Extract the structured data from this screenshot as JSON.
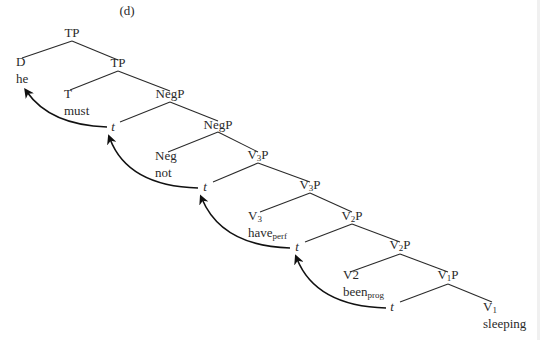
{
  "figure_label": "(d)",
  "figure_label_pos": [
    127,
    4
  ],
  "line_color": "#2a2a2a",
  "nodes": [
    {
      "id": "tp1",
      "cat": "TP",
      "sub": "",
      "word": "",
      "word_sub": "",
      "x": 72,
      "y": 26
    },
    {
      "id": "d",
      "cat": "D",
      "sub": "",
      "word": "he",
      "word_sub": "",
      "x": 16,
      "y": 55,
      "align": "left"
    },
    {
      "id": "tp2",
      "cat": "TP",
      "sub": "",
      "word": "",
      "word_sub": "",
      "x": 118,
      "y": 56
    },
    {
      "id": "t_head",
      "cat": "T",
      "sub": "",
      "word": "must",
      "word_sub": "",
      "x": 64,
      "y": 87,
      "align": "left"
    },
    {
      "id": "negp1",
      "cat": "NegP",
      "sub": "",
      "word": "",
      "word_sub": "",
      "x": 170,
      "y": 87
    },
    {
      "id": "trace1",
      "cat": "t",
      "sub": "",
      "word": "",
      "word_sub": "",
      "x": 113,
      "y": 120,
      "italic": true
    },
    {
      "id": "negp2",
      "cat": "NegP",
      "sub": "",
      "word": "",
      "word_sub": "",
      "x": 218,
      "y": 118
    },
    {
      "id": "neg",
      "cat": "Neg",
      "sub": "",
      "word": "not",
      "word_sub": "",
      "x": 155,
      "y": 149,
      "align": "left"
    },
    {
      "id": "v3p1",
      "cat": "V",
      "sub": "3",
      "cat_suffix": "P",
      "word": "",
      "word_sub": "",
      "x": 258,
      "y": 148
    },
    {
      "id": "trace2",
      "cat": "t",
      "sub": "",
      "word": "",
      "word_sub": "",
      "x": 205,
      "y": 180,
      "italic": true
    },
    {
      "id": "v3p2",
      "cat": "V",
      "sub": "3",
      "cat_suffix": "P",
      "word": "",
      "word_sub": "",
      "x": 310,
      "y": 178
    },
    {
      "id": "v3",
      "cat": "V",
      "sub": "3",
      "word": "have",
      "word_sub": "perf",
      "x": 248,
      "y": 209,
      "align": "left"
    },
    {
      "id": "v2p1",
      "cat": "V",
      "sub": "2",
      "cat_suffix": "P",
      "word": "",
      "word_sub": "",
      "x": 352,
      "y": 209
    },
    {
      "id": "trace3",
      "cat": "t",
      "sub": "",
      "word": "",
      "word_sub": "",
      "x": 297,
      "y": 240,
      "italic": true
    },
    {
      "id": "v2p2",
      "cat": "V",
      "sub": "2",
      "cat_suffix": "P",
      "word": "",
      "word_sub": "",
      "x": 400,
      "y": 238
    },
    {
      "id": "v2",
      "cat": "V2",
      "sub": "",
      "word": "been",
      "word_sub": "prog",
      "x": 343,
      "y": 268,
      "align": "left"
    },
    {
      "id": "v1p",
      "cat": "V",
      "sub": "1",
      "cat_suffix": "P",
      "word": "",
      "word_sub": "",
      "x": 448,
      "y": 268
    },
    {
      "id": "trace4",
      "cat": "t",
      "sub": "",
      "word": "",
      "word_sub": "",
      "x": 392,
      "y": 300,
      "italic": true
    },
    {
      "id": "v1",
      "cat": "V",
      "sub": "1",
      "word": "sleeping",
      "word_sub": "",
      "x": 483,
      "y": 300,
      "align": "left"
    }
  ],
  "edges": [
    [
      72,
      41,
      22,
      58
    ],
    [
      72,
      41,
      118,
      60
    ],
    [
      118,
      71,
      70,
      90
    ],
    [
      118,
      71,
      170,
      91
    ],
    [
      170,
      102,
      120,
      122
    ],
    [
      170,
      102,
      218,
      121
    ],
    [
      218,
      132,
      168,
      152
    ],
    [
      218,
      132,
      258,
      152
    ],
    [
      258,
      163,
      213,
      182
    ],
    [
      258,
      163,
      310,
      182
    ],
    [
      310,
      193,
      260,
      212
    ],
    [
      310,
      193,
      352,
      212
    ],
    [
      352,
      224,
      305,
      242
    ],
    [
      352,
      224,
      400,
      242
    ],
    [
      400,
      254,
      350,
      272
    ],
    [
      400,
      254,
      448,
      272
    ],
    [
      448,
      284,
      400,
      302
    ],
    [
      448,
      284,
      492,
      302
    ]
  ],
  "movement_arrows": [
    {
      "from": [
        107,
        127
      ],
      "ctrl": [
        50,
        125
      ],
      "to": [
        27,
        92
      ]
    },
    {
      "from": [
        198,
        188
      ],
      "ctrl": [
        128,
        186
      ],
      "to": [
        110,
        139
      ]
    },
    {
      "from": [
        290,
        248
      ],
      "ctrl": [
        222,
        246
      ],
      "to": [
        202,
        199
      ]
    },
    {
      "from": [
        386,
        308
      ],
      "ctrl": [
        316,
        306
      ],
      "to": [
        297,
        259
      ]
    }
  ]
}
